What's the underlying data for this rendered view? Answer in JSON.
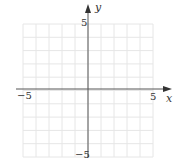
{
  "graph": {
    "x_axis_label": "x",
    "y_axis_label": "y",
    "x_min_label": "−5",
    "x_max_label": "5",
    "y_min_label": "−5",
    "y_max_label": "5",
    "x_range": [
      -5,
      5
    ],
    "y_range": [
      -5,
      5
    ],
    "grid_step": 1,
    "colors": {
      "grid": "#e6e6e6",
      "axis": "#555555",
      "label": "#333333"
    }
  }
}
